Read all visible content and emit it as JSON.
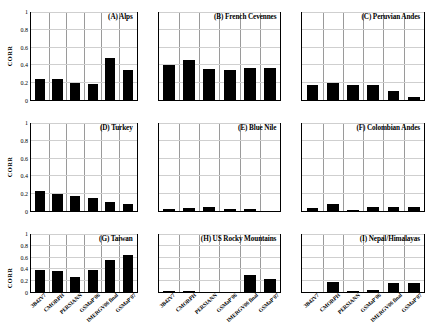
{
  "chart_data": {
    "type": "bar",
    "title": "",
    "xlabel": "",
    "ylabel": "CORR",
    "ylim": [
      0,
      1
    ],
    "ytick_labels": [
      "0",
      "0.2",
      "0.4",
      "0.6",
      "0.8",
      "1"
    ],
    "ytick_values": [
      0,
      0.2,
      0.4,
      0.6,
      0.8,
      1
    ],
    "grid": true,
    "legend": "none",
    "categories": [
      "3B42V7",
      "CMORPH",
      "PERSIANN",
      "GSMaP'06",
      "IMERGV06 final",
      "GSMaP'07"
    ],
    "panels": [
      {
        "id": "A",
        "label": "(A)  Alps",
        "values": [
          0.24,
          0.24,
          0.2,
          0.18,
          0.48,
          0.34
        ]
      },
      {
        "id": "B",
        "label": "(B) French Cevennes",
        "values": [
          0.4,
          0.46,
          0.36,
          0.35,
          0.37,
          0.37
        ]
      },
      {
        "id": "C",
        "label": "(C) Peruvian Andes",
        "values": [
          0.17,
          0.2,
          0.17,
          0.17,
          0.1,
          0.04
        ]
      },
      {
        "id": "D",
        "label": "(D) Turkey",
        "values": [
          0.225,
          0.2,
          0.17,
          0.155,
          0.1,
          0.085
        ]
      },
      {
        "id": "E",
        "label": "(E)  Blue Nile",
        "values": [
          0.02,
          0.035,
          0.05,
          0.02,
          0.02,
          0.0
        ]
      },
      {
        "id": "F",
        "label": "(F) Colombian Andes",
        "values": [
          0.04,
          0.08,
          0.015,
          0.045,
          0.045,
          0.05
        ]
      },
      {
        "id": "G",
        "label": "(G) Taiwan",
        "values": [
          0.38,
          0.36,
          0.27,
          0.39,
          0.57,
          0.65
        ]
      },
      {
        "id": "H",
        "label": "(H) US Rocky Mountains",
        "values": [
          0.012,
          0.012,
          0.0,
          0.0,
          0.3,
          0.22
        ]
      },
      {
        "id": "I",
        "label": "(I) Nepal/Himalayas",
        "values": [
          0.0,
          0.17,
          0.02,
          0.04,
          0.15,
          0.15
        ]
      }
    ]
  },
  "colors": {
    "bar": "#000000",
    "axis": "#000000",
    "gridline": "#9a9a9a",
    "background": "#ffffff"
  }
}
